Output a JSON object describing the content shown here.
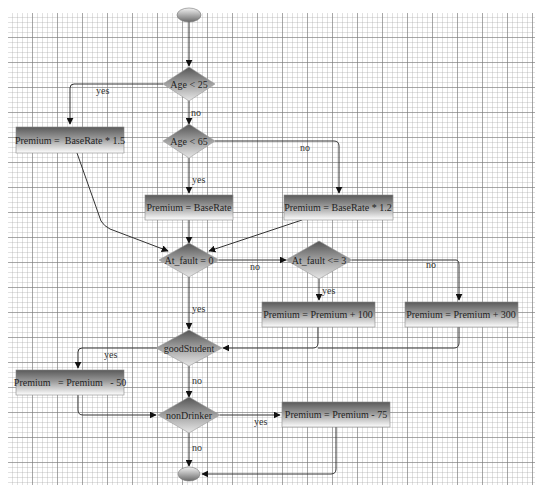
{
  "diagram": {
    "type": "flowchart",
    "nodes": [
      {
        "id": "start",
        "shape": "terminal",
        "label": ""
      },
      {
        "id": "age25",
        "shape": "decision",
        "label": "Age < 25"
      },
      {
        "id": "age65",
        "shape": "decision",
        "label": "Age < 65"
      },
      {
        "id": "p15",
        "shape": "process",
        "label": "Premium =  BaseRate * 1.5"
      },
      {
        "id": "pbase",
        "shape": "process",
        "label": "Premium = BaseRate"
      },
      {
        "id": "p12",
        "shape": "process",
        "label": "Premium = BaseRate * 1.2"
      },
      {
        "id": "fault0",
        "shape": "decision",
        "label": "At_fault = 0"
      },
      {
        "id": "fault3",
        "shape": "decision",
        "label": "At_fault <= 3"
      },
      {
        "id": "p100",
        "shape": "process",
        "label": "Premium = Premium + 100"
      },
      {
        "id": "p300",
        "shape": "process",
        "label": "Premium = Premium + 300"
      },
      {
        "id": "student",
        "shape": "decision",
        "label": "goodStudent"
      },
      {
        "id": "p50",
        "shape": "process",
        "label": "Premium   = Premium   - 50"
      },
      {
        "id": "drinker",
        "shape": "decision",
        "label": "nonDrinker"
      },
      {
        "id": "p75",
        "shape": "process",
        "label": "Premium = Premium - 75"
      },
      {
        "id": "end",
        "shape": "terminal",
        "label": ""
      }
    ],
    "edges": [
      {
        "from": "start",
        "to": "age25",
        "label": ""
      },
      {
        "from": "age25",
        "to": "p15",
        "label": "yes"
      },
      {
        "from": "age25",
        "to": "age65",
        "label": "no"
      },
      {
        "from": "age65",
        "to": "pbase",
        "label": "yes"
      },
      {
        "from": "age65",
        "to": "p12",
        "label": "no"
      },
      {
        "from": "p15",
        "to": "fault0",
        "label": ""
      },
      {
        "from": "pbase",
        "to": "fault0",
        "label": ""
      },
      {
        "from": "p12",
        "to": "fault0",
        "label": ""
      },
      {
        "from": "fault0",
        "to": "fault3",
        "label": "no"
      },
      {
        "from": "fault0",
        "to": "student",
        "label": "yes"
      },
      {
        "from": "fault3",
        "to": "p100",
        "label": "yes"
      },
      {
        "from": "fault3",
        "to": "p300",
        "label": "no"
      },
      {
        "from": "p100",
        "to": "student",
        "label": ""
      },
      {
        "from": "p300",
        "to": "student",
        "label": ""
      },
      {
        "from": "student",
        "to": "p50",
        "label": "yes"
      },
      {
        "from": "student",
        "to": "drinker",
        "label": "no"
      },
      {
        "from": "p50",
        "to": "drinker",
        "label": ""
      },
      {
        "from": "drinker",
        "to": "p75",
        "label": "yes"
      },
      {
        "from": "drinker",
        "to": "end",
        "label": "no"
      },
      {
        "from": "p75",
        "to": "end",
        "label": ""
      }
    ]
  }
}
